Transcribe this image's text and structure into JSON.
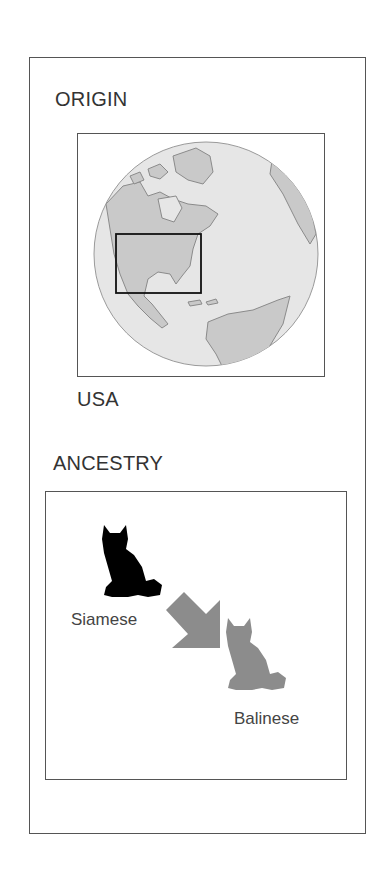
{
  "origin": {
    "heading": "ORIGIN",
    "map_label": "USA",
    "highlight_region": "United States"
  },
  "ancestry": {
    "heading": "ANCESTRY",
    "parent": {
      "name": "Siamese",
      "color": "#000000"
    },
    "child": {
      "name": "Balinese",
      "color": "#8c8c8c"
    },
    "arrow_color": "#8c8c8c"
  },
  "colors": {
    "border": "#555555",
    "globe_ocean": "#e6e6e6",
    "globe_land": "#c9c9c9",
    "text": "#333333"
  }
}
